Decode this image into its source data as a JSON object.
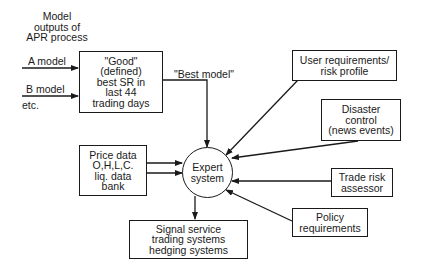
{
  "title_label": [
    "Model",
    "outputs of",
    "APR process"
  ],
  "inputs": {
    "a_model": "A model",
    "b_model": "B model",
    "etc": "etc."
  },
  "good_box": [
    "\"Good\"",
    "(defined)",
    "best SR in",
    "last 44",
    "trading days"
  ],
  "best_model_label": "\"Best model\"",
  "price_box": [
    "Price data",
    "O,H,L,C.",
    "liq. data",
    "bank"
  ],
  "expert": [
    "Expert",
    "system"
  ],
  "signal_box": [
    "Signal service",
    "trading systems",
    "hedging systems"
  ],
  "user_box": [
    "User requirements/",
    "risk profile"
  ],
  "disaster_box": [
    "Disaster",
    "control",
    "(news events)"
  ],
  "trade_box": [
    "Trade risk",
    "assessor"
  ],
  "policy_box": [
    "Policy",
    "requirements"
  ],
  "colors": {
    "line": "#1a1a1a",
    "background": "#ffffff"
  }
}
